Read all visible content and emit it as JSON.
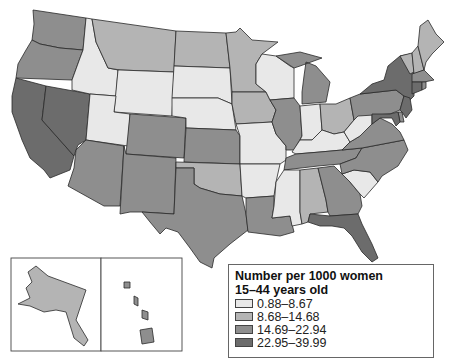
{
  "title": "Number per 1000 women 15–44 years old",
  "legend": {
    "title_line1": "Number per 1000 women",
    "title_line2": "15–44 years old",
    "classes": [
      {
        "label": "0.88–8.67",
        "color": "#e8e8e8"
      },
      {
        "label": "8.68–14.68",
        "color": "#b4b4b4"
      },
      {
        "label": "14.69–22.94",
        "color": "#8e8e8e"
      },
      {
        "label": "22.95–39.99",
        "color": "#6c6c6c"
      }
    ]
  },
  "colors": {
    "c1": "#e8e8e8",
    "c2": "#b4b4b4",
    "c3": "#8e8e8e",
    "c4": "#6c6c6c"
  },
  "states": {
    "WA": "c3",
    "OR": "c3",
    "CA": "c4",
    "NV": "c4",
    "ID": "c1",
    "MT": "c2",
    "WY": "c1",
    "UT": "c1",
    "AZ": "c3",
    "CO": "c3",
    "NM": "c3",
    "ND": "c2",
    "SD": "c1",
    "NE": "c1",
    "KS": "c3",
    "OK": "c2",
    "TX": "c3",
    "MN": "c2",
    "IA": "c2",
    "MO": "c1",
    "AR": "c1",
    "LA": "c3",
    "WI": "c1",
    "IL": "c3",
    "MI": "c3",
    "IN": "c1",
    "OH": "c2",
    "KY": "c1",
    "TN": "c3",
    "MS": "c1",
    "AL": "c2",
    "GA": "c3",
    "FL": "c4",
    "SC": "c1",
    "NC": "c3",
    "VA": "c3",
    "WV": "c1",
    "PA": "c3",
    "NY": "c4",
    "VT": "c2",
    "NH": "c2",
    "ME": "c2",
    "MA": "c3",
    "CT": "c4",
    "RI": "c3",
    "NJ": "c4",
    "DE": "c3",
    "MD": "c4",
    "AK": "c2",
    "HI": "c3"
  }
}
